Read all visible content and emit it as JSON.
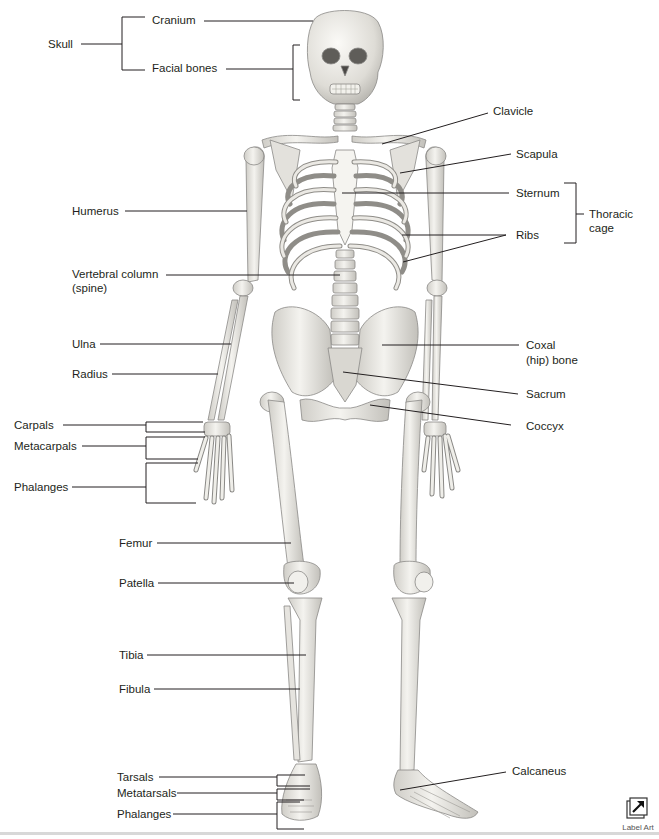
{
  "diagram": {
    "labels_left": [
      {
        "id": "skull",
        "text": "Skull"
      },
      {
        "id": "cranium",
        "text": "Cranium"
      },
      {
        "id": "facial_bones",
        "text": "Facial bones"
      },
      {
        "id": "humerus",
        "text": "Humerus"
      },
      {
        "id": "vertebral_column",
        "text": "Vertebral column"
      },
      {
        "id": "vertebral_column_sub",
        "text": "(spine)"
      },
      {
        "id": "ulna",
        "text": "Ulna"
      },
      {
        "id": "radius",
        "text": "Radius"
      },
      {
        "id": "carpals",
        "text": "Carpals"
      },
      {
        "id": "metacarpals",
        "text": "Metacarpals"
      },
      {
        "id": "phalanges_hand",
        "text": "Phalanges"
      },
      {
        "id": "femur",
        "text": "Femur"
      },
      {
        "id": "patella",
        "text": "Patella"
      },
      {
        "id": "tibia",
        "text": "Tibia"
      },
      {
        "id": "fibula",
        "text": "Fibula"
      },
      {
        "id": "tarsals",
        "text": "Tarsals"
      },
      {
        "id": "metatarsals",
        "text": "Metatarsals"
      },
      {
        "id": "phalanges_foot",
        "text": "Phalanges"
      }
    ],
    "labels_right": [
      {
        "id": "clavicle",
        "text": "Clavicle"
      },
      {
        "id": "scapula",
        "text": "Scapula"
      },
      {
        "id": "sternum",
        "text": "Sternum"
      },
      {
        "id": "ribs",
        "text": "Ribs"
      },
      {
        "id": "thoracic_cage",
        "text": "Thoracic"
      },
      {
        "id": "thoracic_cage_sub",
        "text": "cage"
      },
      {
        "id": "coxal",
        "text": "Coxal"
      },
      {
        "id": "coxal_sub",
        "text": "(hip) bone"
      },
      {
        "id": "sacrum",
        "text": "Sacrum"
      },
      {
        "id": "coccyx",
        "text": "Coccyx"
      },
      {
        "id": "calcaneus",
        "text": "Calcaneus"
      }
    ]
  },
  "toolbar": {
    "label_art_button": "Label Art",
    "label_art_icon": "external-arrow-icon"
  },
  "colors": {
    "text": "#231f20",
    "leader_line": "#231f20",
    "bone_fill": "#ecebe6",
    "bone_stroke": "#8a8986",
    "bone_shadow": "#c9c7c1",
    "footer_rule": "#d8d8d8"
  }
}
